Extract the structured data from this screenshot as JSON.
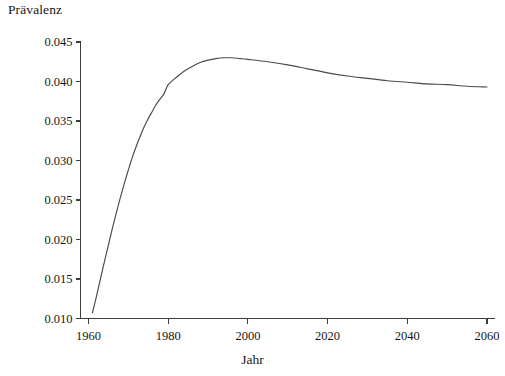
{
  "chart_data": {
    "type": "line",
    "title": "",
    "xlabel": "Jahr",
    "ylabel": "Prävalenz",
    "xlim": [
      1958,
      2062
    ],
    "ylim": [
      0.01,
      0.045
    ],
    "xticks": [
      1960,
      1980,
      2000,
      2020,
      2040,
      2060
    ],
    "xtick_labels": [
      "1960",
      "1980",
      "2000",
      "2020",
      "2040",
      "2060"
    ],
    "yticks": [
      0.01,
      0.015,
      0.02,
      0.025,
      0.03,
      0.035,
      0.04,
      0.045
    ],
    "ytick_labels": [
      "0.010",
      "0.015",
      "0.020",
      "0.025",
      "0.030",
      "0.035",
      "0.040",
      "0.045"
    ],
    "grid": false,
    "legend": null,
    "line_color": "#4a4a4a",
    "axis_color": "#3c3c3c",
    "background_color": "#ffffff",
    "series": [
      {
        "name": "Prävalenz",
        "x": [
          1961,
          1962,
          1963,
          1964,
          1965,
          1966,
          1967,
          1968,
          1969,
          1970,
          1971,
          1972,
          1973,
          1974,
          1975,
          1976,
          1977,
          1978,
          1979,
          1980,
          1982,
          1984,
          1986,
          1988,
          1990,
          1992,
          1994,
          1996,
          1998,
          2000,
          2005,
          2010,
          2015,
          2020,
          2025,
          2030,
          2035,
          2040,
          2045,
          2050,
          2055,
          2060
        ],
        "values": [
          0.0107,
          0.0128,
          0.015,
          0.0172,
          0.0193,
          0.0214,
          0.0234,
          0.0253,
          0.0271,
          0.0288,
          0.0304,
          0.0318,
          0.0331,
          0.0343,
          0.0353,
          0.0362,
          0.0371,
          0.0378,
          0.0385,
          0.0396,
          0.0405,
          0.0413,
          0.0419,
          0.0424,
          0.0427,
          0.0429,
          0.043,
          0.043,
          0.0429,
          0.0428,
          0.0425,
          0.0421,
          0.0416,
          0.0411,
          0.0407,
          0.0404,
          0.0401,
          0.0399,
          0.0397,
          0.0396,
          0.0394,
          0.0393
        ]
      }
    ],
    "annotations": {
      "peak_year": 1996,
      "peak_value": 0.043,
      "start_year": 1961,
      "start_value": 0.0107,
      "end_year": 2060,
      "end_value": 0.0393
    }
  }
}
